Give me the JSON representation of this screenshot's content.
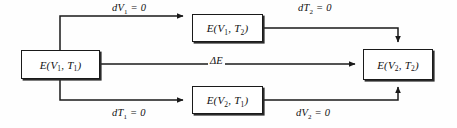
{
  "diagram": {
    "background_color": "#fefefe",
    "line_color": "#1a1a1a",
    "nodes": [
      {
        "id": "left",
        "name": "state-v1-t1",
        "text": "E(V1, T1)",
        "base": "E(V",
        "sub1": "1",
        "mid": ", T",
        "sub2": "1",
        "close": ")"
      },
      {
        "id": "top",
        "name": "state-v1-t2",
        "text": "E(V1, T2)",
        "base": "E(V",
        "sub1": "1",
        "mid": ", T",
        "sub2": "2",
        "close": ")"
      },
      {
        "id": "bottom",
        "name": "state-v2-t1",
        "text": "E(V2, T1)",
        "base": "E(V",
        "sub1": "2",
        "mid": ", T",
        "sub2": "1",
        "close": ")"
      },
      {
        "id": "right",
        "name": "state-v2-t2",
        "text": "E(V2, T2)",
        "base": "E(V",
        "sub1": "2",
        "mid": ", T",
        "sub2": "2",
        "close": ")"
      }
    ],
    "edges": [
      {
        "id": "top_left",
        "text": "dV1 = 0",
        "base": "dV",
        "sub": "1",
        "tail": " = 0"
      },
      {
        "id": "top_right",
        "text": "dT2 = 0",
        "base": "dT",
        "sub": "2",
        "tail": " = 0"
      },
      {
        "id": "middle",
        "text": "ΔE",
        "base": "ΔE",
        "sub": "",
        "tail": ""
      },
      {
        "id": "bottom_left",
        "text": "dT1 = 0",
        "base": "dT",
        "sub": "1",
        "tail": " = 0"
      },
      {
        "id": "bottom_right",
        "text": "dV2 = 0",
        "base": "dV",
        "sub": "2",
        "tail": " = 0"
      }
    ]
  }
}
